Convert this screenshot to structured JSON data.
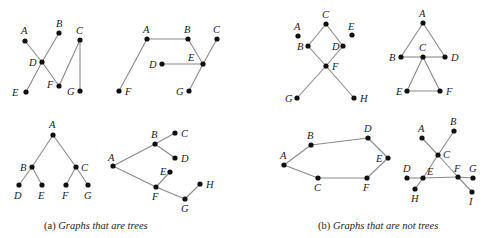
{
  "figure": {
    "captions": {
      "a_prefix": "(a)",
      "a_text": "Graphs that are trees",
      "b_prefix": "(b)",
      "b_text": "Graphs that are not trees"
    },
    "graphs": [
      {
        "id": "tree-1",
        "group": "a",
        "nodes": [
          {
            "id": "A",
            "x": 25,
            "y": 41,
            "lx": 21,
            "ly": 34
          },
          {
            "id": "B",
            "x": 59,
            "y": 33,
            "lx": 56,
            "ly": 27
          },
          {
            "id": "C",
            "x": 80,
            "y": 40,
            "lx": 76,
            "ly": 34
          },
          {
            "id": "D",
            "x": 42,
            "y": 62,
            "lx": 29,
            "ly": 66
          },
          {
            "id": "E",
            "x": 26,
            "y": 92,
            "lx": 12,
            "ly": 96
          },
          {
            "id": "F",
            "x": 59,
            "y": 86,
            "lx": 47,
            "ly": 88
          },
          {
            "id": "G",
            "x": 80,
            "y": 91,
            "lx": 67,
            "ly": 95
          }
        ],
        "edges": [
          [
            "A",
            "D"
          ],
          [
            "D",
            "F"
          ],
          [
            "B",
            "D"
          ],
          [
            "D",
            "E"
          ],
          [
            "F",
            "C"
          ],
          [
            "C",
            "G"
          ]
        ]
      },
      {
        "id": "tree-2",
        "group": "a",
        "nodes": [
          {
            "id": "A",
            "x": 147,
            "y": 39,
            "lx": 143,
            "ly": 33
          },
          {
            "id": "B",
            "x": 188,
            "y": 39,
            "lx": 184,
            "ly": 33
          },
          {
            "id": "C",
            "x": 217,
            "y": 39,
            "lx": 213,
            "ly": 33
          },
          {
            "id": "D",
            "x": 162,
            "y": 64,
            "lx": 149,
            "ly": 68
          },
          {
            "id": "E",
            "x": 203,
            "y": 64,
            "lx": 188,
            "ly": 61
          },
          {
            "id": "F",
            "x": 119,
            "y": 91,
            "lx": 125,
            "ly": 95
          },
          {
            "id": "G",
            "x": 189,
            "y": 91,
            "lx": 176,
            "ly": 95
          }
        ],
        "edges": [
          [
            "A",
            "B"
          ],
          [
            "A",
            "F"
          ],
          [
            "B",
            "E"
          ],
          [
            "C",
            "E"
          ],
          [
            "D",
            "E"
          ],
          [
            "E",
            "G"
          ]
        ]
      },
      {
        "id": "tree-3",
        "group": "a",
        "nodes": [
          {
            "id": "A",
            "x": 53,
            "y": 135,
            "lx": 49,
            "ly": 128
          },
          {
            "id": "B",
            "x": 32,
            "y": 167,
            "lx": 20,
            "ly": 171
          },
          {
            "id": "C",
            "x": 76,
            "y": 167,
            "lx": 81,
            "ly": 171
          },
          {
            "id": "D",
            "x": 19,
            "y": 185,
            "lx": 14,
            "ly": 199
          },
          {
            "id": "E",
            "x": 42,
            "y": 185,
            "lx": 38,
            "ly": 199
          },
          {
            "id": "F",
            "x": 66,
            "y": 185,
            "lx": 62,
            "ly": 199
          },
          {
            "id": "G",
            "x": 88,
            "y": 185,
            "lx": 84,
            "ly": 199
          }
        ],
        "edges": [
          [
            "A",
            "B"
          ],
          [
            "A",
            "C"
          ],
          [
            "B",
            "D"
          ],
          [
            "B",
            "E"
          ],
          [
            "C",
            "F"
          ],
          [
            "C",
            "G"
          ]
        ]
      },
      {
        "id": "tree-4",
        "group": "a",
        "nodes": [
          {
            "id": "A",
            "x": 113,
            "y": 166,
            "lx": 108,
            "ly": 161
          },
          {
            "id": "B",
            "x": 155,
            "y": 144,
            "lx": 151,
            "ly": 138
          },
          {
            "id": "C",
            "x": 175,
            "y": 133,
            "lx": 181,
            "ly": 137
          },
          {
            "id": "D",
            "x": 175,
            "y": 158,
            "lx": 181,
            "ly": 162
          },
          {
            "id": "E",
            "x": 170,
            "y": 172,
            "lx": 160,
            "ly": 175
          },
          {
            "id": "F",
            "x": 156,
            "y": 187,
            "lx": 152,
            "ly": 200
          },
          {
            "id": "G",
            "x": 185,
            "y": 199,
            "lx": 181,
            "ly": 212
          },
          {
            "id": "H",
            "x": 200,
            "y": 184,
            "lx": 206,
            "ly": 188
          }
        ],
        "edges": [
          [
            "A",
            "B"
          ],
          [
            "B",
            "C"
          ],
          [
            "B",
            "D"
          ],
          [
            "A",
            "F"
          ],
          [
            "F",
            "E"
          ],
          [
            "F",
            "G"
          ],
          [
            "G",
            "H"
          ]
        ]
      },
      {
        "id": "nontree-1",
        "group": "b",
        "nodes": [
          {
            "id": "A",
            "x": 298,
            "y": 36,
            "lx": 294,
            "ly": 30
          },
          {
            "id": "B",
            "x": 308,
            "y": 46,
            "lx": 297,
            "ly": 50
          },
          {
            "id": "C",
            "x": 326,
            "y": 24,
            "lx": 322,
            "ly": 18
          },
          {
            "id": "D",
            "x": 343,
            "y": 46,
            "lx": 332,
            "ly": 50
          },
          {
            "id": "E",
            "x": 352,
            "y": 35,
            "lx": 348,
            "ly": 30
          },
          {
            "id": "F",
            "x": 326,
            "y": 66,
            "lx": 332,
            "ly": 70
          },
          {
            "id": "G",
            "x": 297,
            "y": 98,
            "lx": 285,
            "ly": 102
          },
          {
            "id": "H",
            "x": 354,
            "y": 98,
            "lx": 360,
            "ly": 102
          }
        ],
        "edges": [
          [
            "B",
            "C"
          ],
          [
            "C",
            "D"
          ],
          [
            "B",
            "F"
          ],
          [
            "D",
            "F"
          ],
          [
            "F",
            "G"
          ],
          [
            "F",
            "H"
          ]
        ]
      },
      {
        "id": "nontree-2",
        "group": "b",
        "nodes": [
          {
            "id": "A",
            "x": 423,
            "y": 23,
            "lx": 419,
            "ly": 17
          },
          {
            "id": "B",
            "x": 401,
            "y": 57,
            "lx": 389,
            "ly": 61
          },
          {
            "id": "C",
            "x": 423,
            "y": 57,
            "lx": 419,
            "ly": 51
          },
          {
            "id": "D",
            "x": 445,
            "y": 57,
            "lx": 451,
            "ly": 61
          },
          {
            "id": "E",
            "x": 407,
            "y": 91,
            "lx": 396,
            "ly": 95
          },
          {
            "id": "F",
            "x": 440,
            "y": 91,
            "lx": 446,
            "ly": 95
          }
        ],
        "edges": [
          [
            "A",
            "B"
          ],
          [
            "A",
            "D"
          ],
          [
            "B",
            "C"
          ],
          [
            "C",
            "D"
          ],
          [
            "C",
            "E"
          ],
          [
            "C",
            "F"
          ],
          [
            "E",
            "F"
          ]
        ]
      },
      {
        "id": "nontree-3",
        "group": "b",
        "nodes": [
          {
            "id": "A",
            "x": 284,
            "y": 165,
            "lx": 280,
            "ly": 159
          },
          {
            "id": "B",
            "x": 311,
            "y": 145,
            "lx": 307,
            "ly": 139
          },
          {
            "id": "C",
            "x": 318,
            "y": 178,
            "lx": 314,
            "ly": 191
          },
          {
            "id": "D",
            "x": 368,
            "y": 138,
            "lx": 364,
            "ly": 132
          },
          {
            "id": "E",
            "x": 388,
            "y": 158,
            "lx": 376,
            "ly": 162
          },
          {
            "id": "F",
            "x": 367,
            "y": 178,
            "lx": 363,
            "ly": 191
          }
        ],
        "edges": [
          [
            "A",
            "B"
          ],
          [
            "B",
            "D"
          ],
          [
            "D",
            "E"
          ],
          [
            "E",
            "F"
          ],
          [
            "F",
            "C"
          ],
          [
            "C",
            "A"
          ]
        ]
      },
      {
        "id": "nontree-4",
        "group": "b",
        "nodes": [
          {
            "id": "A",
            "x": 422,
            "y": 138,
            "lx": 418,
            "ly": 132
          },
          {
            "id": "B",
            "x": 454,
            "y": 131,
            "lx": 450,
            "ly": 125
          },
          {
            "id": "C",
            "x": 438,
            "y": 155,
            "lx": 443,
            "ly": 158
          },
          {
            "id": "D",
            "x": 407,
            "y": 178,
            "lx": 403,
            "ly": 172
          },
          {
            "id": "E",
            "x": 423,
            "y": 178,
            "lx": 427,
            "ly": 175
          },
          {
            "id": "F",
            "x": 458,
            "y": 177,
            "lx": 454,
            "ly": 172
          },
          {
            "id": "G",
            "x": 473,
            "y": 178,
            "lx": 469,
            "ly": 172
          },
          {
            "id": "H",
            "x": 415,
            "y": 189,
            "lx": 411,
            "ly": 202
          },
          {
            "id": "I",
            "x": 472,
            "y": 192,
            "lx": 469,
            "ly": 205
          }
        ],
        "edges": [
          [
            "A",
            "C"
          ],
          [
            "C",
            "B"
          ],
          [
            "C",
            "E"
          ],
          [
            "C",
            "F"
          ],
          [
            "D",
            "E"
          ],
          [
            "E",
            "F"
          ],
          [
            "F",
            "G"
          ],
          [
            "E",
            "H"
          ],
          [
            "F",
            "I"
          ]
        ]
      }
    ]
  }
}
